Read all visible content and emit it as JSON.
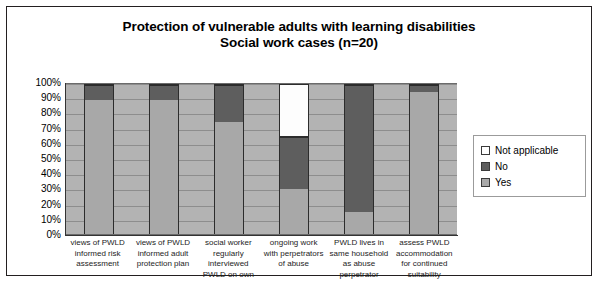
{
  "chart_data": {
    "type": "bar",
    "subtype": "stacked-percent",
    "title": "Protection of vulnerable adults with learning disabilities",
    "subtitle": "Social work cases (n=20)",
    "xlabel": "",
    "ylabel": "",
    "ylim": [
      0,
      100
    ],
    "grid": true,
    "legend_position": "right",
    "y_tick_labels": [
      "100%",
      "90%",
      "80%",
      "70%",
      "60%",
      "50%",
      "40%",
      "30%",
      "20%",
      "10%",
      "0%"
    ],
    "y_tick_values": [
      100,
      90,
      80,
      70,
      60,
      50,
      40,
      30,
      20,
      10,
      0
    ],
    "categories": [
      "views of PWLD informed risk assessment",
      "views of PWLD informed adult protection plan",
      "social worker regularly interviewed PWLD on own",
      "ongoing work with perpetrators of abuse",
      "PWLD lives in same household as abuse perpetrator",
      "assess PWLD accommodation for continued suitability"
    ],
    "category_lines": [
      [
        "views of PWLD",
        "informed risk",
        "assessment"
      ],
      [
        "views of PWLD",
        "informed adult",
        "protection plan"
      ],
      [
        "social worker",
        "regularly",
        "interviewed",
        "PWLD on own"
      ],
      [
        "ongoing work",
        "with perpetrators",
        "of abuse"
      ],
      [
        "PWLD lives in",
        "same household",
        "as abuse",
        "perpetrator"
      ],
      [
        "assess PWLD",
        "accommodation",
        "for continued",
        "suitability"
      ]
    ],
    "series": [
      {
        "name": "Yes",
        "color": "#a8a8a8",
        "values": [
          90,
          90,
          75,
          30,
          15,
          95
        ]
      },
      {
        "name": "No",
        "color": "#5e5e5e",
        "values": [
          10,
          10,
          25,
          35,
          85,
          5
        ]
      },
      {
        "name": "Not applicable",
        "color": "#ffffff",
        "values": [
          0,
          0,
          0,
          35,
          0,
          0
        ]
      }
    ],
    "legend_entries": [
      {
        "label": "Not applicable",
        "color": "#ffffff"
      },
      {
        "label": "No",
        "color": "#5e5e5e"
      },
      {
        "label": "Yes",
        "color": "#a8a8a8"
      }
    ]
  }
}
